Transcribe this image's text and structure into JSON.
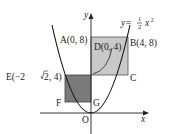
{
  "diagram": {
    "type": "coordinate-geometry",
    "axes": {
      "x_label": "x",
      "y_label": "y",
      "origin_label": "O"
    },
    "curve": {
      "equation_prefix": "y=",
      "coef_num": "1",
      "coef_den": "2",
      "var": "x",
      "exp": "2"
    },
    "points": {
      "A": "A(0, 8)",
      "B": "B(4, 8)",
      "C": "C",
      "D": "D(0, 4)",
      "E_prefix": "E(−2",
      "E_rad": "2",
      "E_suffix": ", 4)",
      "F": "F",
      "G": "G"
    },
    "colors": {
      "rect_ABCD_fill": "#c9c9c9",
      "square_EFGD_fill": "#7a7a7a",
      "stroke": "#222222"
    }
  }
}
